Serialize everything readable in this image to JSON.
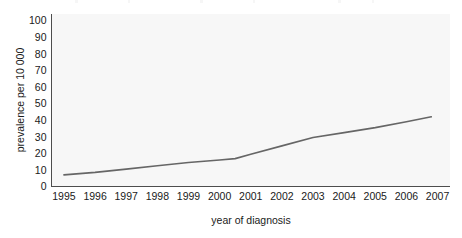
{
  "chart_data": {
    "type": "line",
    "title": "",
    "xlabel": "year of diagnosis",
    "ylabel": "prevalence per 10 000",
    "xlim": [
      1994.6,
      2007.4
    ],
    "ylim": [
      0,
      104
    ],
    "xticks": [
      1995,
      1996,
      1997,
      1998,
      1999,
      2000,
      2001,
      2002,
      2003,
      2004,
      2005,
      2006,
      2007
    ],
    "xtick_labels": [
      "1995",
      "1996",
      "1997",
      "1998",
      "1999",
      "2000",
      "2001",
      "2002",
      "2003",
      "2004",
      "2005",
      "2006",
      "2007"
    ],
    "yticks": [
      0,
      10,
      20,
      30,
      40,
      50,
      60,
      70,
      80,
      90,
      100
    ],
    "ytick_labels": [
      "0",
      "10",
      "20",
      "30",
      "40",
      "50",
      "60",
      "70",
      "80",
      "90",
      "100"
    ],
    "grid": false,
    "legend": null,
    "series": [
      {
        "name": "prevalence",
        "color": "#666666",
        "line_width": 1.6,
        "x": [
          1995,
          1996,
          1997,
          1998,
          1999,
          2000,
          2000.5,
          2001,
          2002,
          2003,
          2004,
          2005,
          2006,
          2006.8
        ],
        "values": [
          7,
          8.5,
          10.5,
          12.5,
          14.5,
          16,
          16.8,
          19.5,
          24.5,
          29.5,
          32.5,
          35.5,
          39,
          42
        ]
      }
    ],
    "annotations": []
  },
  "axes": {
    "y_axis_title": "prevalence per 10 000",
    "x_axis_title": "year of diagnosis"
  },
  "colors": {
    "line": "#666666",
    "plot_background": "#f7f7f7",
    "figure_background": "#ffffff",
    "axis": "#4d4d4d",
    "text": "#1a1a1a"
  }
}
